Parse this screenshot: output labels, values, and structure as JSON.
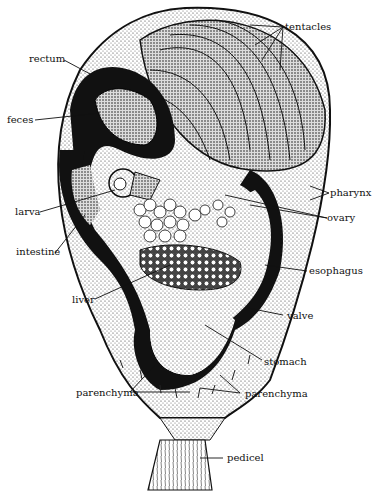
{
  "figure": {
    "labels": {
      "tentacles": "tentacles",
      "rectum": "rectum",
      "feces": "feces",
      "pharynx": "pharynx",
      "ovary": "ovary",
      "larva": "larva",
      "intestine": "intestine",
      "esophagus": "esophagus",
      "liver": "liver",
      "valve": "valve",
      "stomach": "stomach",
      "parenchyma_left": "parenchyma",
      "parenchyma_right": "parenchyma",
      "pedicel": "pedicel"
    }
  }
}
